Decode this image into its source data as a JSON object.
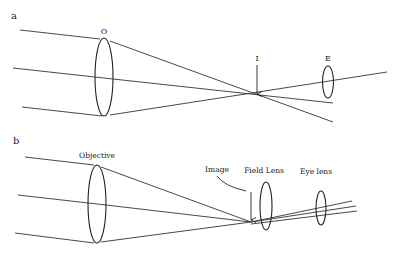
{
  "figure": {
    "panels": [
      {
        "id": "a",
        "label": "a",
        "lenses": [
          {
            "name": "objective",
            "label": "O"
          },
          {
            "name": "eyepiece",
            "label": "E"
          }
        ],
        "image_marker": {
          "label": "I"
        }
      },
      {
        "id": "b",
        "label": "b",
        "lenses": [
          {
            "name": "objective",
            "label": "Objective"
          },
          {
            "name": "field-lens",
            "label": "Field Lens"
          },
          {
            "name": "eye-lens",
            "label": "Eye lens"
          }
        ],
        "image_marker": {
          "label": "Image"
        }
      }
    ],
    "colors": {
      "line": "#333333",
      "background": "#ffffff"
    }
  }
}
